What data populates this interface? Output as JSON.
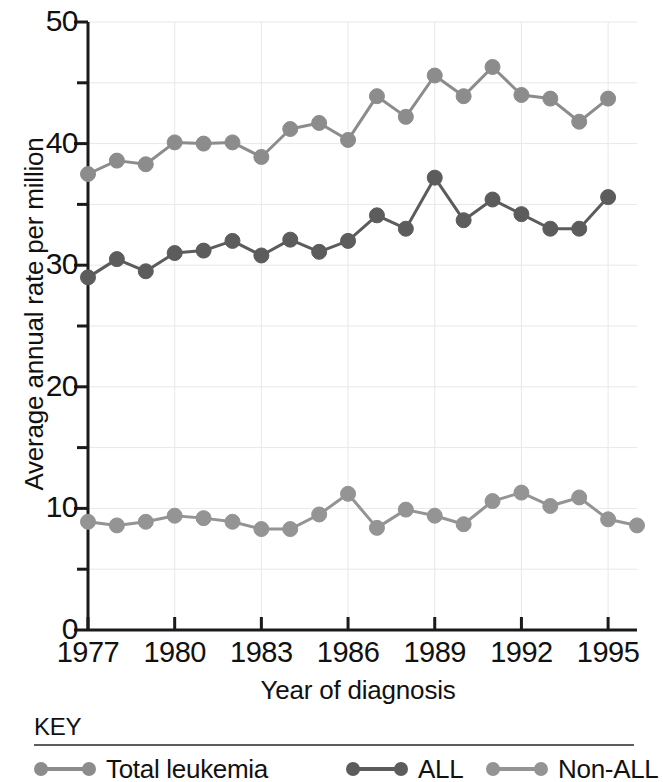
{
  "chart_data": {
    "type": "line",
    "title": "",
    "subtitle": "",
    "xlabel": "Year of diagnosis",
    "ylabel": "Average annual rate per million",
    "xlim": [
      1977,
      1996
    ],
    "ylim": [
      0,
      50
    ],
    "grid": true,
    "legend_position": "bottom",
    "legend_title": "KEY",
    "y_ticks_major": [
      0,
      10,
      20,
      30,
      40,
      50
    ],
    "y_ticks_minor": [
      5,
      15,
      25,
      35,
      45
    ],
    "y_tick_labels": [
      "0",
      "10",
      "20",
      "30",
      "40",
      "50"
    ],
    "x_ticks": [
      1977,
      1980,
      1983,
      1986,
      1989,
      1992,
      1995
    ],
    "x_tick_labels": [
      "1977",
      "1980",
      "1983",
      "1986",
      "1989",
      "1992",
      "1995"
    ],
    "x": [
      1977,
      1978,
      1979,
      1980,
      1981,
      1982,
      1983,
      1984,
      1985,
      1986,
      1987,
      1988,
      1989,
      1990,
      1991,
      1992,
      1993,
      1994,
      1995,
      1996
    ],
    "series": [
      {
        "name": "Total leukemia",
        "color": "#8c8c8c",
        "values": [
          37.5,
          38.6,
          38.3,
          40.1,
          40.0,
          40.1,
          38.9,
          41.2,
          41.7,
          40.3,
          43.9,
          42.2,
          45.6,
          43.9,
          46.3,
          44.0,
          43.7,
          41.8,
          43.7,
          null
        ]
      },
      {
        "name": "ALL",
        "color": "#5c5c5c",
        "values": [
          29.0,
          30.5,
          29.5,
          31.0,
          31.2,
          32.0,
          30.8,
          32.1,
          31.1,
          32.0,
          34.1,
          33.0,
          37.2,
          33.7,
          35.4,
          34.2,
          33.0,
          33.0,
          35.6,
          null
        ]
      },
      {
        "name": "Non-ALL",
        "color": "#949494",
        "values": [
          8.9,
          8.6,
          8.9,
          9.4,
          9.2,
          8.9,
          8.3,
          8.3,
          9.5,
          11.2,
          8.4,
          9.9,
          9.4,
          8.7,
          10.6,
          11.3,
          10.2,
          10.9,
          9.1,
          8.6
        ]
      }
    ]
  },
  "axes": {
    "y_title": "Average annual rate per million",
    "x_title": "Year of diagnosis"
  },
  "key": {
    "title": "KEY",
    "items": [
      {
        "label": "Total leukemia",
        "color": "#8c8c8c"
      },
      {
        "label": "ALL",
        "color": "#5c5c5c"
      },
      {
        "label": "Non-ALL",
        "color": "#949494"
      }
    ]
  },
  "colors": {
    "axis": "#1a1a1a",
    "grid": "#e8e8e8",
    "background": "#ffffff",
    "key_rule": "#5e5e5e"
  }
}
